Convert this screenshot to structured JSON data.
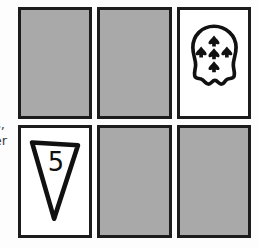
{
  "page": {
    "background_color": "#fdfdfd",
    "width": 258,
    "height": 248
  },
  "margin_caption": {
    "line_1": "s,",
    "line_2": "ver",
    "note": "text clipped at left edge of image",
    "color": "#3b3b3b"
  },
  "palette": {
    "card_fill_hidden": "#a9a9a9",
    "card_fill_revealed": "#ffffff",
    "card_border": "#1c1c1c",
    "ink": "#111111"
  },
  "grid": {
    "rows": 2,
    "columns": 3,
    "cards": [
      {
        "id": "card-r1c1",
        "row": 1,
        "column": 1,
        "state": "hidden",
        "fill": "#a9a9a9",
        "symbol": "",
        "value": "",
        "x": 18,
        "y": 7,
        "width": 74,
        "height": 112
      },
      {
        "id": "card-r1c2",
        "row": 1,
        "column": 2,
        "state": "hidden",
        "fill": "#a9a9a9",
        "symbol": "",
        "value": "",
        "x": 97,
        "y": 7,
        "width": 75,
        "height": 112
      },
      {
        "id": "card-r1c3",
        "row": 1,
        "column": 3,
        "state": "revealed",
        "fill": "#ffffff",
        "symbol": "blob-ghost-icon",
        "value": "6",
        "pip_count": 6,
        "x": 177,
        "y": 7,
        "width": 74,
        "height": 112
      },
      {
        "id": "card-r2c1",
        "row": 2,
        "column": 1,
        "state": "revealed",
        "fill": "#ffffff",
        "symbol": "inverted-triangle-icon",
        "value": "5",
        "x": 18,
        "y": 125,
        "width": 74,
        "height": 113
      },
      {
        "id": "card-r2c2",
        "row": 2,
        "column": 2,
        "state": "hidden",
        "fill": "#a9a9a9",
        "symbol": "",
        "value": "",
        "x": 97,
        "y": 125,
        "width": 75,
        "height": 113
      },
      {
        "id": "card-r2c3",
        "row": 2,
        "column": 3,
        "state": "hidden",
        "fill": "#a9a9a9",
        "symbol": "",
        "value": "",
        "x": 177,
        "y": 125,
        "width": 74,
        "height": 113
      }
    ]
  }
}
